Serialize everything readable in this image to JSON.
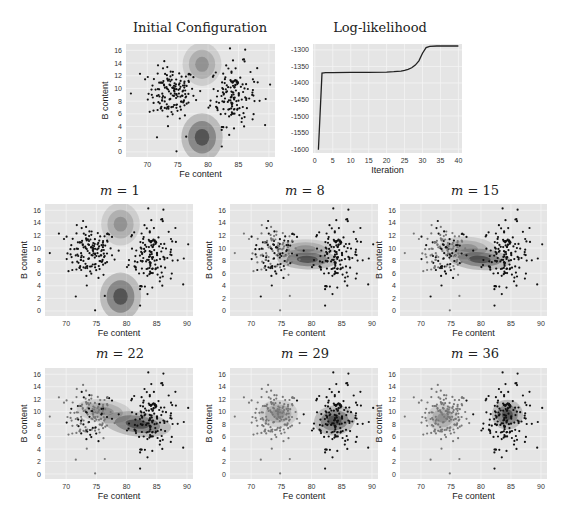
{
  "chart_data": [
    {
      "id": "initial",
      "type": "scatter",
      "title": "Initial Configuration",
      "xlabel": "Fe content",
      "ylabel": "B content",
      "xlim": [
        66.5,
        91
      ],
      "ylim": [
        -0.8,
        17
      ],
      "xticks": [
        70,
        75,
        80,
        85,
        90
      ],
      "yticks": [
        0,
        2,
        4,
        6,
        8,
        10,
        12,
        14,
        16
      ],
      "grid": true,
      "clusters": [
        {
          "name": "cluster-1",
          "mean": [
            79,
            13.8
          ],
          "sd": [
            1.6,
            1.7
          ],
          "rho": 0,
          "color": "#7a7a7a"
        },
        {
          "name": "cluster-2",
          "mean": [
            79,
            2.3
          ],
          "sd": [
            1.7,
            1.9
          ],
          "rho": 0,
          "color": "#2a2a2a"
        }
      ],
      "point_coloring": "single"
    },
    {
      "id": "loglik",
      "type": "line",
      "title": "Log-likelihood",
      "xlabel": "Iteration",
      "ylabel": "",
      "xlim": [
        -0.5,
        41
      ],
      "ylim": [
        -1612,
        -1282
      ],
      "xticks": [
        0,
        5,
        10,
        15,
        20,
        25,
        30,
        35,
        40
      ],
      "yticks": [
        -1300,
        -1350,
        -1400,
        -1450,
        -1500,
        -1550,
        -1600
      ],
      "grid": true,
      "x": [
        1,
        2,
        3,
        5,
        10,
        15,
        20,
        22,
        24,
        25,
        26,
        27,
        28,
        29,
        30,
        31,
        32,
        34,
        36,
        38,
        40
      ],
      "y": [
        -1602,
        -1370,
        -1369,
        -1369,
        -1368,
        -1368,
        -1367,
        -1366,
        -1364,
        -1362,
        -1359,
        -1354,
        -1346,
        -1333,
        -1310,
        -1293,
        -1289,
        -1288,
        -1288,
        -1288,
        -1288
      ]
    },
    {
      "id": "m1",
      "type": "scatter",
      "title_var": "m",
      "title_val": "1",
      "xlabel": "Fe content",
      "ylabel": "B content",
      "xlim": [
        66.5,
        91
      ],
      "ylim": [
        -0.8,
        17
      ],
      "xticks": [
        70,
        75,
        80,
        85,
        90
      ],
      "yticks": [
        0,
        2,
        4,
        6,
        8,
        10,
        12,
        14,
        16
      ],
      "clusters": [
        {
          "name": "cluster-1",
          "mean": [
            79,
            13.8
          ],
          "sd": [
            1.6,
            1.7
          ],
          "rho": 0,
          "color": "#7a7a7a"
        },
        {
          "name": "cluster-2",
          "mean": [
            79,
            2.3
          ],
          "sd": [
            1.7,
            1.9
          ],
          "rho": 0,
          "color": "#2a2a2a"
        }
      ],
      "point_coloring": "single"
    },
    {
      "id": "m8",
      "type": "scatter",
      "title_var": "m",
      "title_val": "8",
      "xlabel": "Fe content",
      "ylabel": "B content",
      "xlim": [
        66.5,
        91
      ],
      "ylim": [
        -0.8,
        17
      ],
      "xticks": [
        70,
        75,
        80,
        85,
        90
      ],
      "yticks": [
        0,
        2,
        4,
        6,
        8,
        10,
        12,
        14,
        16
      ],
      "clusters": [
        {
          "name": "cluster-1",
          "mean": [
            79,
            9.9
          ],
          "sd": [
            2.4,
            0.75
          ],
          "rho": 0,
          "color": "#7a7a7a"
        },
        {
          "name": "cluster-2",
          "mean": [
            79.3,
            8.2
          ],
          "sd": [
            2.5,
            0.8
          ],
          "rho": -0.05,
          "color": "#2a2a2a"
        }
      ],
      "point_coloring": "mixed",
      "mix": 0.5
    },
    {
      "id": "m15",
      "type": "scatter",
      "title_var": "m",
      "title_val": "15",
      "xlabel": "Fe content",
      "ylabel": "B content",
      "xlim": [
        66.5,
        91
      ],
      "ylim": [
        -0.8,
        17
      ],
      "xticks": [
        70,
        75,
        80,
        85,
        90
      ],
      "yticks": [
        0,
        2,
        4,
        6,
        8,
        10,
        12,
        14,
        16
      ],
      "clusters": [
        {
          "name": "cluster-1",
          "mean": [
            77.8,
            10.0
          ],
          "sd": [
            2.4,
            0.9
          ],
          "rho": -0.1,
          "color": "#7a7a7a"
        },
        {
          "name": "cluster-2",
          "mean": [
            79.8,
            8.2
          ],
          "sd": [
            2.6,
            0.85
          ],
          "rho": -0.1,
          "color": "#2a2a2a"
        }
      ],
      "point_coloring": "mixed",
      "mix": 0.6
    },
    {
      "id": "m22",
      "type": "scatter",
      "title_var": "m",
      "title_val": "22",
      "xlabel": "Fe content",
      "ylabel": "B content",
      "xlim": [
        66.5,
        91
      ],
      "ylim": [
        -0.8,
        17
      ],
      "xticks": [
        70,
        75,
        80,
        85,
        90
      ],
      "yticks": [
        0,
        2,
        4,
        6,
        8,
        10,
        12,
        14,
        16
      ],
      "clusters": [
        {
          "name": "cluster-1",
          "mean": [
            76.3,
            10.1
          ],
          "sd": [
            2.3,
            0.95
          ],
          "rho": -0.2,
          "color": "#7a7a7a"
        },
        {
          "name": "cluster-2",
          "mean": [
            81.8,
            8.0
          ],
          "sd": [
            2.8,
            1.0
          ],
          "rho": -0.2,
          "color": "#2a2a2a"
        }
      ],
      "point_coloring": "mixed",
      "mix": 0.75
    },
    {
      "id": "m29",
      "type": "scatter",
      "title_var": "m",
      "title_val": "29",
      "xlabel": "Fe content",
      "ylabel": "B content",
      "xlim": [
        66.5,
        91
      ],
      "ylim": [
        -0.8,
        17
      ],
      "xticks": [
        70,
        75,
        80,
        85,
        90
      ],
      "yticks": [
        0,
        2,
        4,
        6,
        8,
        10,
        12,
        14,
        16
      ],
      "clusters": [
        {
          "name": "cluster-1",
          "mean": [
            74.5,
            9.7
          ],
          "sd": [
            1.6,
            1.1
          ],
          "rho": 0,
          "color": "#7a7a7a"
        },
        {
          "name": "cluster-2",
          "mean": [
            83.8,
            8.6
          ],
          "sd": [
            1.7,
            1.2
          ],
          "rho": 0.2,
          "color": "#2a2a2a"
        }
      ],
      "point_coloring": "split"
    },
    {
      "id": "m36",
      "type": "scatter",
      "title_var": "m",
      "title_val": "36",
      "xlabel": "Fe content",
      "ylabel": "B content",
      "xlim": [
        66.5,
        91
      ],
      "ylim": [
        -0.8,
        17
      ],
      "xticks": [
        70,
        75,
        80,
        85,
        90
      ],
      "yticks": [
        0,
        2,
        4,
        6,
        8,
        10,
        12,
        14,
        16
      ],
      "clusters": [
        {
          "name": "cluster-1",
          "mean": [
            73.6,
            9.0
          ],
          "sd": [
            1.3,
            1.1
          ],
          "rho": 0,
          "color": "#7a7a7a"
        },
        {
          "name": "cluster-2",
          "mean": [
            84.4,
            9.5
          ],
          "sd": [
            1.3,
            1.2
          ],
          "rho": 0,
          "color": "#2a2a2a"
        }
      ],
      "point_coloring": "split"
    }
  ],
  "layout": {
    "plot_bg": "#e5e5e5",
    "grid_color": "#f4f4f4",
    "point_dark": "#111111",
    "point_gray": "#777777",
    "line_color": "#222222"
  }
}
